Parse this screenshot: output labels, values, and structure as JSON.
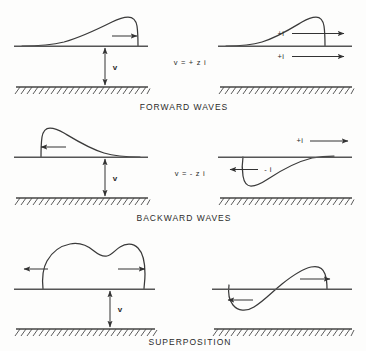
{
  "figure": {
    "background_color": "#fdfdfc",
    "ink_color": "#3a3a3a"
  },
  "rows": [
    {
      "id": "forward",
      "caption": "FORWARD WAVES",
      "equation": "v = + z i",
      "left": {
        "voltage_label": "v",
        "wave_shape": "sawtooth pulse, gradual rise to rounded peak then steep fall",
        "direction": "right"
      },
      "right": {
        "current_label_upper": "+i",
        "current_label_lower": "+i",
        "upper_direction": "right",
        "lower_direction": "right"
      }
    },
    {
      "id": "backward",
      "caption": "BACKWARD WAVES",
      "equation": "v = - z i",
      "left": {
        "voltage_label": "v",
        "wave_shape": "mirrored sawtooth pulse, steep rise then gradual decay",
        "direction": "left"
      },
      "right": {
        "current_label_upper": "+i",
        "current_label_lower": "- i",
        "upper_direction": "right",
        "lower_direction": "left"
      }
    },
    {
      "id": "superposition",
      "caption": "SUPERPOSITION",
      "left": {
        "voltage_label": "v",
        "wave_shape": "flat-topped double-humped pulse",
        "direction": "both"
      },
      "right": {
        "wave_shape": "antisymmetric S curve, negative lobe left and positive lobe right",
        "left_lobe_direction": "left",
        "right_lobe_direction": "right"
      }
    }
  ]
}
